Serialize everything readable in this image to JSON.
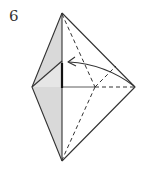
{
  "step": {
    "number": "6"
  },
  "diagram": {
    "colors": {
      "line": "#333333",
      "shaded_face": "#d9d9d9",
      "paper": "#ffffff"
    },
    "vertices": {
      "top": [
        62,
        13
      ],
      "bottom": [
        62,
        161
      ],
      "left": [
        32,
        87
      ],
      "right": [
        135,
        87
      ],
      "center": [
        95,
        87
      ],
      "inner_flap": [
        62,
        61
      ]
    },
    "arrow": {
      "from": [
        134,
        86
      ],
      "to": [
        67,
        62
      ],
      "type": "valley-fold"
    }
  }
}
